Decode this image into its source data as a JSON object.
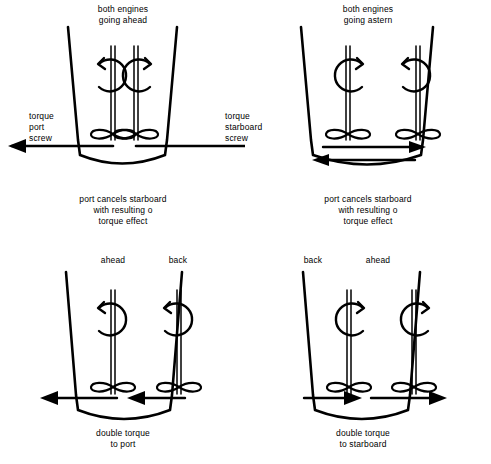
{
  "figure": {
    "title": "twin-screw propeller torque effect diagram",
    "stroke_color": "#000000",
    "background_color": "#ffffff"
  },
  "panels": [
    {
      "id": "top-left",
      "heading_line1": "both engines",
      "heading_line2": "going ahead",
      "left_label_line1": "torque",
      "left_label_line2": "port",
      "left_label_line3": "screw",
      "right_label_line1": "torque",
      "right_label_line2": "starboard",
      "right_label_line3": "screw",
      "caption_line1": "port cancels starboard",
      "caption_line2": "with resulting o",
      "caption_line3": "torque effect",
      "port_rotation": "counter-clockwise",
      "starboard_rotation": "clockwise",
      "port_torque_direction": "left",
      "starboard_torque_direction": "right"
    },
    {
      "id": "top-right",
      "heading_line1": "both engines",
      "heading_line2": "going astern",
      "caption_line1": "port cancels starboard",
      "caption_line2": "with resulting o",
      "caption_line3": "torque effect",
      "port_rotation": "clockwise",
      "starboard_rotation": "counter-clockwise",
      "upper_arrow_direction": "right",
      "lower_arrow_direction": "left"
    },
    {
      "id": "bottom-left",
      "port_engine_label": "ahead",
      "starboard_engine_label": "back",
      "caption_line1": "double torque",
      "caption_line2": "to port",
      "port_rotation": "counter-clockwise",
      "starboard_rotation": "counter-clockwise",
      "port_torque_direction": "left",
      "starboard_torque_direction": "left"
    },
    {
      "id": "bottom-right",
      "port_engine_label": "back",
      "starboard_engine_label": "ahead",
      "caption_line1": "double torque",
      "caption_line2": "to starboard",
      "port_rotation": "clockwise",
      "starboard_rotation": "clockwise",
      "port_torque_direction": "right",
      "starboard_torque_direction": "right"
    }
  ]
}
